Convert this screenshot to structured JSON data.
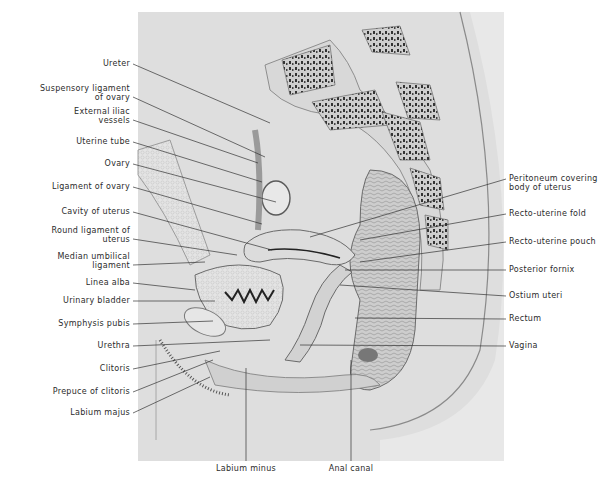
{
  "figure": {
    "colors": {
      "background": "#ffffff",
      "plate": "#dedede",
      "ink": "#2b2b2b",
      "bone": "#3a3a3a"
    }
  },
  "labels_left": [
    {
      "id": "ureter",
      "lines": [
        "Ureter"
      ],
      "x": 133,
      "y": 64,
      "tx": 270,
      "ty": 123
    },
    {
      "id": "suspensory-ligament-of-ovary",
      "lines": [
        "Suspensory ligament",
        "of ovary"
      ],
      "x": 133,
      "y": 93,
      "tx": 265,
      "ty": 157
    },
    {
      "id": "external-iliac-vessels",
      "lines": [
        "External iliac",
        "vessels"
      ],
      "x": 133,
      "y": 116,
      "tx": 258,
      "ty": 163
    },
    {
      "id": "uterine-tube",
      "lines": [
        "Uterine tube"
      ],
      "x": 133,
      "y": 142,
      "tx": 262,
      "ty": 182
    },
    {
      "id": "ovary",
      "lines": [
        "Ovary"
      ],
      "x": 133,
      "y": 164,
      "tx": 276,
      "ty": 202
    },
    {
      "id": "ligament-of-ovary",
      "lines": [
        "Ligament of ovary"
      ],
      "x": 133,
      "y": 187,
      "tx": 262,
      "ty": 224
    },
    {
      "id": "cavity-of-uterus",
      "lines": [
        "Cavity of uterus"
      ],
      "x": 133,
      "y": 212,
      "tx": 272,
      "ty": 250
    },
    {
      "id": "round-ligament-of-uterus",
      "lines": [
        "Round ligament of",
        "uterus"
      ],
      "x": 133,
      "y": 235,
      "tx": 237,
      "ty": 255
    },
    {
      "id": "median-umbilical-ligament",
      "lines": [
        "Median umbilical",
        "ligament"
      ],
      "x": 133,
      "y": 261,
      "tx": 205,
      "ty": 262
    },
    {
      "id": "linea-alba",
      "lines": [
        "Linea alba"
      ],
      "x": 133,
      "y": 283,
      "tx": 195,
      "ty": 290
    },
    {
      "id": "urinary-bladder",
      "lines": [
        "Urinary bladder"
      ],
      "x": 133,
      "y": 301,
      "tx": 215,
      "ty": 301
    },
    {
      "id": "symphysis-pubis",
      "lines": [
        "Symphysis pubis"
      ],
      "x": 133,
      "y": 324,
      "tx": 213,
      "ty": 321
    },
    {
      "id": "urethra",
      "lines": [
        "Urethra"
      ],
      "x": 133,
      "y": 346,
      "tx": 270,
      "ty": 340
    },
    {
      "id": "clitoris",
      "lines": [
        "Clitoris"
      ],
      "x": 133,
      "y": 369,
      "tx": 220,
      "ty": 351
    },
    {
      "id": "prepuce-of-clitoris",
      "lines": [
        "Prepuce of clitoris"
      ],
      "x": 133,
      "y": 392,
      "tx": 213,
      "ty": 360
    },
    {
      "id": "labium-majus",
      "lines": [
        "Labium majus"
      ],
      "x": 133,
      "y": 413,
      "tx": 210,
      "ty": 377
    }
  ],
  "labels_right": [
    {
      "id": "peritoneum-covering-body-of-uterus",
      "lines": [
        "Peritoneum covering",
        "body of uterus"
      ],
      "x": 506,
      "y": 183,
      "tx": 310,
      "ty": 237
    },
    {
      "id": "recto-uterine-fold",
      "lines": [
        "Recto-uterine fold"
      ],
      "x": 506,
      "y": 214,
      "tx": 360,
      "ty": 240
    },
    {
      "id": "recto-uterine-pouch",
      "lines": [
        "Recto-uterine pouch"
      ],
      "x": 506,
      "y": 242,
      "tx": 360,
      "ty": 262
    },
    {
      "id": "posterior-fornix",
      "lines": [
        "Posterior fornix"
      ],
      "x": 506,
      "y": 270,
      "tx": 345,
      "ty": 270
    },
    {
      "id": "ostium-uteri",
      "lines": [
        "Ostium uteri"
      ],
      "x": 506,
      "y": 296,
      "tx": 340,
      "ty": 285
    },
    {
      "id": "rectum",
      "lines": [
        "Rectum"
      ],
      "x": 506,
      "y": 319,
      "tx": 355,
      "ty": 318
    },
    {
      "id": "vagina",
      "lines": [
        "Vagina"
      ],
      "x": 506,
      "y": 346,
      "tx": 300,
      "ty": 345
    }
  ],
  "labels_bottom": [
    {
      "id": "labium-minus",
      "lines": [
        "Labium minus"
      ],
      "x": 246,
      "y": 468,
      "tx": 246,
      "ty": 368
    },
    {
      "id": "anal-canal",
      "lines": [
        "Anal canal"
      ],
      "x": 351,
      "y": 468,
      "tx": 351,
      "ty": 360
    }
  ]
}
